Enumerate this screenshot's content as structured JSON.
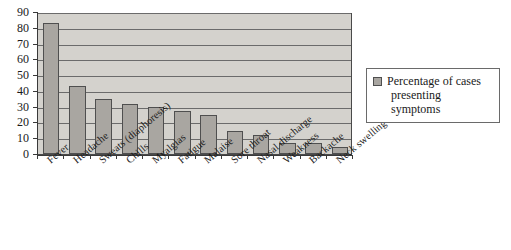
{
  "chart_data": {
    "type": "bar",
    "title": "",
    "xlabel": "",
    "ylabel": "",
    "ylim": [
      0,
      90
    ],
    "ytick_step": 10,
    "yticks": [
      0,
      10,
      20,
      30,
      40,
      50,
      60,
      70,
      80,
      90
    ],
    "grid": true,
    "legend_position": "right",
    "categories": [
      "Fever",
      "Headache",
      "Sweats (diaphoresis)",
      "Chills",
      "Myalgias",
      "Fatigue",
      "Malaise",
      "Sore throat",
      "Nasal discharge",
      "Weakness",
      "Backache",
      "Neck swelling"
    ],
    "series": [
      {
        "name": "Percentage of cases presenting symptoms",
        "values": [
          83,
          43,
          35,
          32,
          30,
          27,
          24.5,
          14.5,
          12,
          7,
          7,
          4.5
        ]
      }
    ]
  },
  "legend": {
    "line1": "Percentage of cases",
    "line2": "presenting symptoms",
    "swatch_color": "#a9a6a1"
  },
  "colors": {
    "bar_fill": "#a9a6a1",
    "bar_border": "#4f4f4f",
    "plot_background": "#d4d2cd",
    "gridline": "#6b6b6b",
    "axis": "#3a3a3a",
    "text": "#1a1a1a",
    "page_background": "#ffffff"
  }
}
